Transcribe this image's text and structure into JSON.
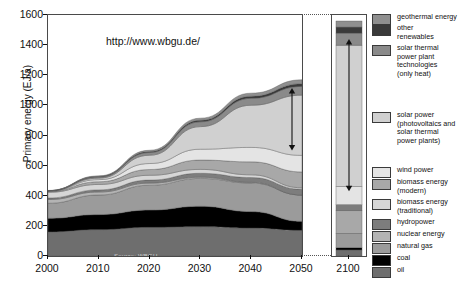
{
  "chart_data": {
    "type": "area",
    "title": "",
    "xlabel": "",
    "ylabel": "Primary energy (EJ/a)",
    "ylim": [
      0,
      1600
    ],
    "xlim": [
      2000,
      2050
    ],
    "grid": false,
    "legend_position": "right",
    "annotation_url": "http://www.wbgu.de/",
    "source_note": "Source: WBGU",
    "yticks": [
      0,
      200,
      400,
      600,
      800,
      1000,
      1200,
      1400,
      1600
    ],
    "xticks": [
      2000,
      2010,
      2020,
      2030,
      2040,
      2050
    ],
    "second_panel_tick": 2100,
    "x": [
      2000,
      2010,
      2020,
      2030,
      2040,
      2050
    ],
    "series": [
      {
        "name": "oil",
        "color": "#6e6e6e",
        "values": [
          160,
          175,
          190,
          195,
          185,
          170
        ]
      },
      {
        "name": "coal",
        "color": "#000000",
        "values": [
          90,
          100,
          115,
          135,
          110,
          60
        ]
      },
      {
        "name": "natural gas",
        "color": "#9b9b9b",
        "values": [
          100,
          130,
          165,
          185,
          190,
          175
        ]
      },
      {
        "name": "nuclear energy",
        "color": "#b4b4b4",
        "values": [
          25,
          20,
          14,
          8,
          4,
          0
        ]
      },
      {
        "name": "hydropower",
        "color": "#7d7d7d",
        "values": [
          10,
          14,
          20,
          26,
          32,
          38
        ]
      },
      {
        "name": "biomass energy (traditional)",
        "color": "#d6d6d6",
        "values": [
          38,
          36,
          32,
          26,
          18,
          10
        ]
      },
      {
        "name": "biomass energy (modern)",
        "color": "#a8a8a8",
        "values": [
          5,
          18,
          38,
          62,
          86,
          105
        ]
      },
      {
        "name": "wind power",
        "color": "#e4e4e4",
        "values": [
          2,
          14,
          40,
          72,
          96,
          110
        ]
      },
      {
        "name": "solar power (photovoltaics and solar thermal power plants)",
        "color": "#d0d0d0",
        "values": [
          1,
          10,
          55,
          150,
          280,
          400
        ]
      },
      {
        "name": "solar thermal power plant technologies (only heat)",
        "color": "#8a8a8a",
        "values": [
          2,
          8,
          18,
          32,
          46,
          58
        ]
      },
      {
        "name": "other renewables",
        "color": "#3a3a3a",
        "values": [
          1,
          3,
          6,
          10,
          14,
          18
        ]
      },
      {
        "name": "geothermal energy",
        "color": "#8f8f8f",
        "values": [
          1,
          4,
          9,
          14,
          20,
          26
        ]
      }
    ],
    "totals": [
      435,
      532,
      702,
      915,
      1081,
      1170
    ],
    "panel_2100": {
      "year": 2100,
      "total": 1560,
      "stack": [
        {
          "name": "oil",
          "color": "#6e6e6e",
          "value": 40
        },
        {
          "name": "coal",
          "color": "#000000",
          "value": 15
        },
        {
          "name": "natural gas",
          "color": "#9b9b9b",
          "value": 95
        },
        {
          "name": "biomass energy (modern)",
          "color": "#a8a8a8",
          "value": 150
        },
        {
          "name": "hydropower",
          "color": "#7d7d7d",
          "value": 40
        },
        {
          "name": "wind power",
          "color": "#e4e4e4",
          "value": 120
        },
        {
          "name": "solar power",
          "color": "#d0d0d0",
          "value": 940
        },
        {
          "name": "solar thermal (only heat)",
          "color": "#8a8a8a",
          "value": 80
        },
        {
          "name": "other renewables",
          "color": "#3a3a3a",
          "value": 40
        },
        {
          "name": "geothermal energy",
          "color": "#8f8f8f",
          "value": 40
        }
      ]
    },
    "annotations": [
      {
        "name": "solar-band-arrow-2050",
        "at_year": 2050,
        "from": 700,
        "to": 1115,
        "style": "double-headed"
      },
      {
        "name": "solar-band-arrow-2100",
        "at_year": 2100,
        "from": 430,
        "to": 1440,
        "style": "double-headed"
      }
    ]
  },
  "legend": {
    "items": [
      {
        "label": "geothermal energy",
        "color": "#8f8f8f"
      },
      {
        "label": "other\nrenewables",
        "color": "#3a3a3a"
      },
      {
        "label": "solar thermal\npower plant\ntechnologies\n(only heat)",
        "color": "#8a8a8a"
      },
      {
        "label": "solar power\n(photovoltaics and\nsolar thermal\npower plants)",
        "color": "#d0d0d0"
      },
      {
        "label": "wind power",
        "color": "#e4e4e4"
      },
      {
        "label": "biomass energy\n(modern)",
        "color": "#a8a8a8"
      },
      {
        "label": "biomass energy\n(traditional)",
        "color": "#d6d6d6"
      },
      {
        "label": "hydropower",
        "color": "#7d7d7d"
      },
      {
        "label": "nuclear energy",
        "color": "#b4b4b4"
      },
      {
        "label": "natural gas",
        "color": "#9b9b9b"
      },
      {
        "label": "coal",
        "color": "#000000"
      },
      {
        "label": "oil",
        "color": "#6e6e6e"
      }
    ]
  },
  "axis": {
    "ylabel": "Primary energy (EJ/a)",
    "yticks": [
      "1600",
      "1400",
      "1200",
      "1000",
      "800",
      "600",
      "400",
      "200",
      "0"
    ],
    "xticks": [
      "2000",
      "2010",
      "2020",
      "2030",
      "2040",
      "2050"
    ],
    "xtick_right": "2100"
  },
  "overlay": {
    "url": "http://www.wbgu.de/",
    "source": "Source: WBGU"
  }
}
